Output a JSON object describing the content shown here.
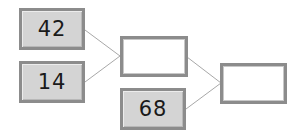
{
  "diagram": {
    "type": "addition-tree",
    "boxes": [
      {
        "id": "a",
        "value": "42",
        "filled": true
      },
      {
        "id": "b",
        "value": "14",
        "filled": true
      },
      {
        "id": "c",
        "value": "",
        "filled": false
      },
      {
        "id": "d",
        "value": "68",
        "filled": true
      },
      {
        "id": "e",
        "value": "",
        "filled": false
      }
    ],
    "connections": [
      {
        "from": "a",
        "to": "c"
      },
      {
        "from": "b",
        "to": "c"
      },
      {
        "from": "c",
        "to": "e"
      },
      {
        "from": "d",
        "to": "e"
      }
    ],
    "colors": {
      "box_fill": "#d4d4d4",
      "box_border": "#8c8c8c",
      "empty_fill": "#ffffff",
      "line": "#a8a8a8"
    }
  }
}
